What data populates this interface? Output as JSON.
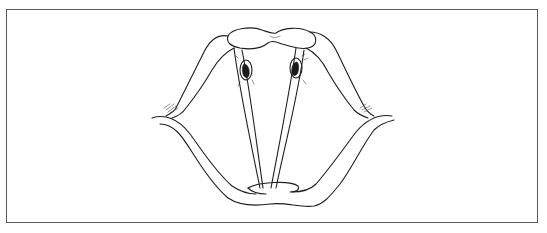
{
  "figure": {
    "type": "anatomical line drawing",
    "border_color": "#5a5a5a",
    "line_color": "#1e1e1e",
    "background": "#ffffff",
    "labels": []
  }
}
